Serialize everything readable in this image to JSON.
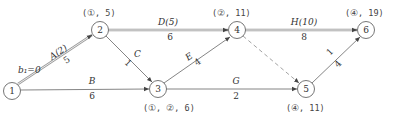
{
  "diagram": {
    "type": "activity-on-arrow network (critical path labeling)",
    "start_label": "b₁=0",
    "nodes": [
      {
        "id": "1",
        "label": "1",
        "annotation": ""
      },
      {
        "id": "2",
        "label": "2",
        "annotation": "(①, 5)"
      },
      {
        "id": "3",
        "label": "3",
        "annotation": "(①, ②, 6)"
      },
      {
        "id": "4",
        "label": "4",
        "annotation": "(②, 11)"
      },
      {
        "id": "5",
        "label": "5",
        "annotation": "(④, 11)"
      },
      {
        "id": "6",
        "label": "6",
        "annotation": "(④, 19)"
      }
    ],
    "edges": [
      {
        "from": "1",
        "to": "2",
        "name": "A(2)",
        "duration": "5",
        "style": "double"
      },
      {
        "from": "1",
        "to": "3",
        "name": "B",
        "duration": "6",
        "style": "single"
      },
      {
        "from": "2",
        "to": "3",
        "name": "C",
        "duration": "1",
        "style": "single"
      },
      {
        "from": "2",
        "to": "4",
        "name": "D(5)",
        "duration": "6",
        "style": "double"
      },
      {
        "from": "3",
        "to": "4",
        "name": "E",
        "duration": "4",
        "style": "single"
      },
      {
        "from": "3",
        "to": "5",
        "name": "G",
        "duration": "2",
        "style": "single"
      },
      {
        "from": "4",
        "to": "5",
        "name": "",
        "duration": "",
        "style": "dashed"
      },
      {
        "from": "4",
        "to": "6",
        "name": "H(10)",
        "duration": "8",
        "style": "double"
      },
      {
        "from": "5",
        "to": "6",
        "name": "",
        "duration": "4",
        "extra": "1",
        "style": "single"
      }
    ]
  }
}
